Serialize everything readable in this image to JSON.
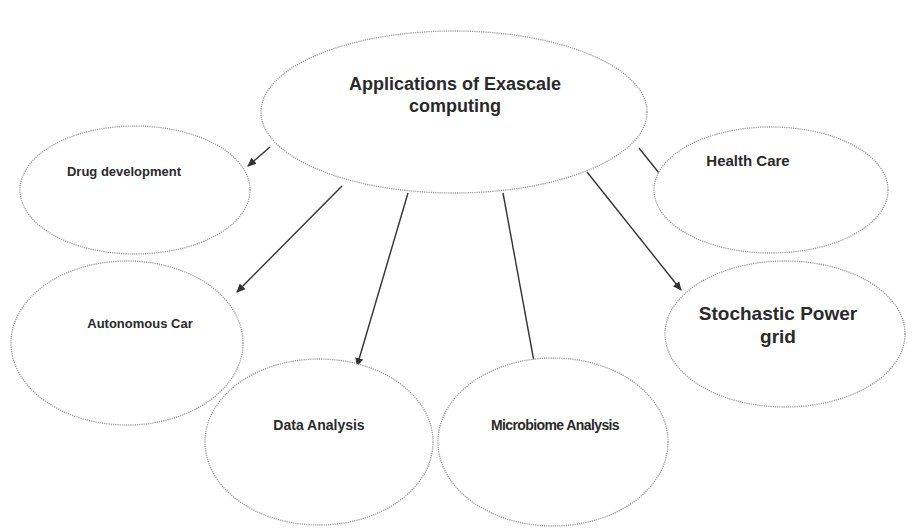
{
  "diagram": {
    "title": "Applications of Exascale computing",
    "root": {
      "id": "root",
      "label_line1": "Applications of Exascale",
      "label_line2": "computing"
    },
    "children": [
      {
        "id": "drug",
        "label": "Drug development"
      },
      {
        "id": "health",
        "label": "Health Care"
      },
      {
        "id": "car",
        "label": "Autonomous Car"
      },
      {
        "id": "power",
        "label_line1": "Stochastic Power",
        "label_line2": "grid"
      },
      {
        "id": "data",
        "label": "Data Analysis"
      },
      {
        "id": "micro",
        "label": "Microbiome Analysis"
      }
    ],
    "edges": [
      {
        "from": "root",
        "to": "drug"
      },
      {
        "from": "root",
        "to": "health"
      },
      {
        "from": "root",
        "to": "car"
      },
      {
        "from": "root",
        "to": "power"
      },
      {
        "from": "root",
        "to": "data"
      },
      {
        "from": "root",
        "to": "micro"
      }
    ],
    "colors": {
      "stroke": "#9a9a9a",
      "arrow": "#333333",
      "text": "#2a2a2a"
    }
  }
}
